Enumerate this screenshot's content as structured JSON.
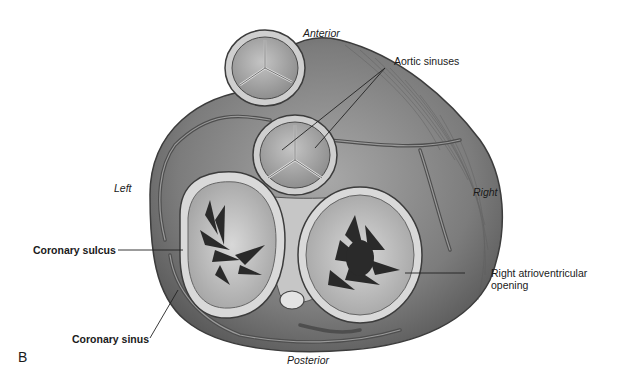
{
  "figure": {
    "panel_letter": "B",
    "orientation": {
      "top": "Anterior",
      "bottom": "Posterior",
      "left": "Left",
      "right": "Right"
    },
    "labels": [
      {
        "id": "aortic_sinuses",
        "text": "Aortic sinuses"
      },
      {
        "id": "coronary_sulcus",
        "text": "Coronary sulcus"
      },
      {
        "id": "coronary_sinus",
        "text": "Coronary sinus"
      },
      {
        "id": "right_av_opening",
        "text": "Right atrioventricular opening"
      }
    ],
    "colors": {
      "tissue_dark": "#5a5a5a",
      "tissue_mid": "#8a8a8a",
      "tissue_light": "#b8b8b8",
      "valve_ring": "#d6d6d6",
      "vessel": "#6e6e6e",
      "leader_line": "#222222"
    }
  }
}
